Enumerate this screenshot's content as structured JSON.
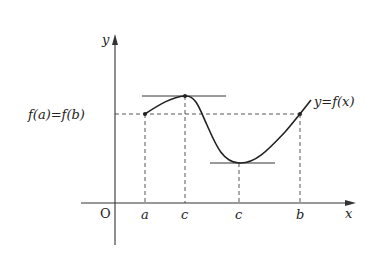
{
  "diagram": {
    "type": "rolle-theorem-graph",
    "axes": {
      "x_label": "x",
      "y_label": "y",
      "origin_label": "O"
    },
    "x_ticks": [
      {
        "label": "a"
      },
      {
        "label": "c"
      },
      {
        "label": "c"
      },
      {
        "label": "b"
      }
    ],
    "y_level_label": "f(a)=f(b)",
    "curve_label": "y=f(x)",
    "colors": {
      "ink": "#222222",
      "background": "#ffffff"
    }
  }
}
